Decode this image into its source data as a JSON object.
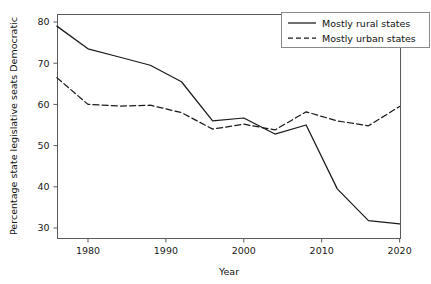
{
  "chart_data": {
    "type": "line",
    "title": "",
    "xlabel": "Year",
    "ylabel": "Percentage state legislative seats Democratic",
    "xlim": [
      1976,
      2020
    ],
    "ylim": [
      28,
      81
    ],
    "grid": false,
    "legend_position": "top-right",
    "x": [
      1976,
      1980,
      1984,
      1988,
      1992,
      1996,
      2000,
      2004,
      2008,
      2012,
      2016,
      2020
    ],
    "xticks": [
      1980,
      1990,
      2000,
      2010,
      2020
    ],
    "xtick_labels": [
      "1980",
      "1990",
      "2000",
      "2010",
      "2020"
    ],
    "yticks": [
      30,
      40,
      50,
      60,
      70,
      80
    ],
    "ytick_labels": [
      "30",
      "40",
      "50",
      "60",
      "70",
      "80"
    ],
    "series": [
      {
        "name": "Mostly rural states",
        "style": "solid",
        "color": "#1a1a1a",
        "values": [
          79.0,
          73.5,
          71.5,
          69.5,
          65.5,
          56.0,
          56.7,
          52.8,
          55.0,
          39.5,
          31.8,
          31.0
        ]
      },
      {
        "name": "Mostly urban states",
        "style": "dashed",
        "color": "#1a1a1a",
        "values": [
          66.5,
          60.0,
          59.6,
          59.8,
          58.0,
          54.0,
          55.2,
          53.8,
          58.2,
          56.0,
          54.8,
          59.5
        ]
      }
    ]
  },
  "legend": {
    "items": [
      {
        "label": "Mostly rural states",
        "style": "solid"
      },
      {
        "label": "Mostly urban states",
        "style": "dashed"
      }
    ]
  }
}
